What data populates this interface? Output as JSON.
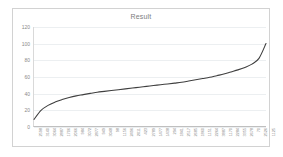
{
  "chart_data": {
    "type": "line",
    "title": "Result",
    "xlabel": "",
    "ylabel": "",
    "ylim": [
      0,
      120
    ],
    "y_ticks": [
      0,
      20,
      40,
      60,
      80,
      100,
      120
    ],
    "grid": true,
    "legend": false,
    "legend_position": "none",
    "series_color": "#3f3f3f",
    "categories": [
      "2598",
      "3140",
      "3064",
      "2887",
      "1706",
      "2066",
      "984",
      "3072",
      "2877",
      "949",
      "3048",
      "98",
      "1156",
      "2496",
      "2011",
      "423",
      "2789",
      "1477",
      "1438",
      "294",
      "1841",
      "2517",
      "2685",
      "1860",
      "1151",
      "2264",
      "3887",
      "1170",
      "2284",
      "3355",
      "2678",
      "70",
      "2526",
      "1125"
    ],
    "values": [
      8,
      19,
      25,
      29,
      32,
      34.5,
      36.5,
      38,
      39.5,
      41,
      42,
      43,
      44,
      45,
      46,
      47,
      48,
      49,
      50,
      51,
      52,
      53,
      54.5,
      56,
      57.5,
      59,
      61,
      63,
      65.5,
      68,
      71,
      75,
      82,
      100
    ]
  }
}
